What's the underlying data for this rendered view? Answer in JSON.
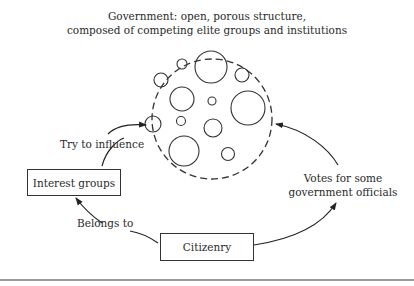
{
  "title": {
    "line1": "Government: open, porous structure,",
    "line2": "composed of competing elite groups and institutions"
  },
  "nodes": {
    "government": {
      "label": "Government",
      "shape": "dashed-circle"
    },
    "interest_groups": {
      "label": "Interest groups"
    },
    "citizenry": {
      "label": "Citizenry"
    }
  },
  "edges": {
    "interest_to_government": {
      "label": "Try to influence",
      "from": "Interest groups",
      "to": "Government"
    },
    "citizenry_to_interest": {
      "label": "Belongs to",
      "from": "Citizenry",
      "to": "Interest groups"
    },
    "citizenry_to_government": {
      "label_line1": "Votes for some",
      "label_line2": "government officials",
      "from": "Citizenry",
      "to": "Government"
    }
  },
  "colors": {
    "stroke": "#333333",
    "background": "#ffffff",
    "rule": "#9a9a9a"
  }
}
